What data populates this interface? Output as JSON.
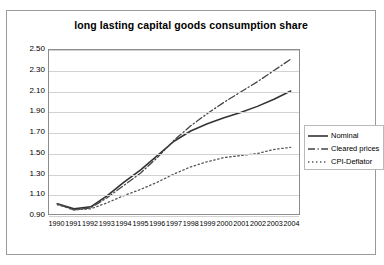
{
  "chart_data": {
    "type": "line",
    "title": "long lasting capital goods consumption share",
    "xlabel": "",
    "ylabel": "",
    "grid": true,
    "legend_position": "right",
    "ylim": [
      0.9,
      2.5
    ],
    "ytick_labels": [
      "2.50",
      "2.30",
      "2.10",
      "1.90",
      "1.70",
      "1.50",
      "1.30",
      "1.10",
      "0.90"
    ],
    "ytick_values": [
      2.5,
      2.3,
      2.1,
      1.9,
      1.7,
      1.5,
      1.3,
      1.1,
      0.9
    ],
    "categories": [
      "1990",
      "1991",
      "1992",
      "1993",
      "1994",
      "1995",
      "1996",
      "1997",
      "1998",
      "1999",
      "2000",
      "2001",
      "2002",
      "2003",
      "2004"
    ],
    "series": [
      {
        "name": "Nominal",
        "style": "solid",
        "color": "#333333",
        "values": [
          1.0,
          0.95,
          0.97,
          1.08,
          1.21,
          1.33,
          1.47,
          1.61,
          1.71,
          1.78,
          1.84,
          1.89,
          1.95,
          2.02,
          2.1
        ]
      },
      {
        "name": "Cleared prices",
        "style": "dash-dot",
        "color": "#444444",
        "values": [
          1.0,
          0.94,
          0.96,
          1.06,
          1.18,
          1.3,
          1.45,
          1.62,
          1.76,
          1.88,
          1.99,
          2.09,
          2.19,
          2.3,
          2.41
        ]
      },
      {
        "name": "CPI-Deflator",
        "style": "dotted",
        "color": "#555555",
        "values": [
          0.99,
          0.94,
          0.95,
          1.01,
          1.08,
          1.14,
          1.21,
          1.29,
          1.36,
          1.41,
          1.45,
          1.47,
          1.49,
          1.53,
          1.55
        ]
      }
    ]
  },
  "legend": {
    "items": [
      {
        "label": "Nominal"
      },
      {
        "label": "Cleared prices"
      },
      {
        "label": "CPI-Deflator"
      }
    ]
  }
}
